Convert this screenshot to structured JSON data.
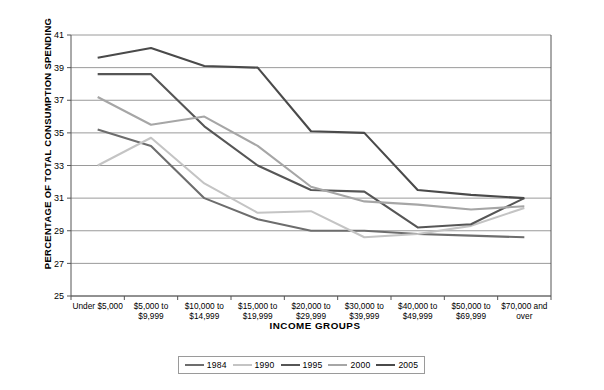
{
  "chart_data": {
    "type": "line",
    "title": "",
    "xlabel": "INCOME GROUPS",
    "ylabel": "PERCENTAGE OF TOTAL CONSUMPTION SPENDING",
    "ylim": [
      25,
      41
    ],
    "yticks": [
      25,
      27,
      29,
      31,
      33,
      35,
      37,
      39,
      41
    ],
    "grid": true,
    "legend_position": "bottom",
    "categories": [
      "Under $5,000",
      "$5,000 to $9,999",
      "$10,000 to $14,999",
      "$15,000 to $19,999",
      "$20,000 to $29,999",
      "$30,000 to $39,999",
      "$40,000 to $49,999",
      "$50,000 to $69,999",
      "$70,000 and over"
    ],
    "category_lines": [
      [
        "Under $5,000",
        ""
      ],
      [
        "$5,000 to",
        "$9,999"
      ],
      [
        "$10,000 to",
        "$14,999"
      ],
      [
        "$15,000 to",
        "$19,999"
      ],
      [
        "$20,000 to",
        "$29,999"
      ],
      [
        "$30,000 to",
        "$39,999"
      ],
      [
        "$40,000 to",
        "$49,999"
      ],
      [
        "$50,000 to",
        "$69,999"
      ],
      [
        "$70,000 and",
        "over"
      ]
    ],
    "series": [
      {
        "name": "1984",
        "color": "#6d6d6d",
        "values": [
          35.2,
          34.2,
          31.0,
          29.7,
          29.0,
          29.0,
          28.8,
          28.7,
          28.6
        ]
      },
      {
        "name": "1990",
        "color": "#c4c4c4",
        "values": [
          33.0,
          34.7,
          31.9,
          30.1,
          30.2,
          28.6,
          28.8,
          29.3,
          30.4
        ]
      },
      {
        "name": "1995",
        "color": "#565656",
        "values": [
          38.6,
          38.6,
          35.4,
          33.0,
          31.5,
          31.4,
          29.2,
          29.4,
          31.0
        ]
      },
      {
        "name": "2000",
        "color": "#a6a6a6",
        "values": [
          37.2,
          35.5,
          36.0,
          34.2,
          31.7,
          30.8,
          30.6,
          30.3,
          30.5
        ]
      },
      {
        "name": "2005",
        "color": "#4a4a4a",
        "values": [
          39.6,
          40.2,
          39.1,
          39.0,
          35.1,
          35.0,
          31.5,
          31.2,
          31.0
        ]
      }
    ]
  },
  "legend": {
    "items": [
      {
        "label": "1984",
        "color": "#6d6d6d"
      },
      {
        "label": "1990",
        "color": "#c4c4c4"
      },
      {
        "label": "1995",
        "color": "#565656"
      },
      {
        "label": "2000",
        "color": "#a6a6a6"
      },
      {
        "label": "2005",
        "color": "#4a4a4a"
      }
    ]
  }
}
